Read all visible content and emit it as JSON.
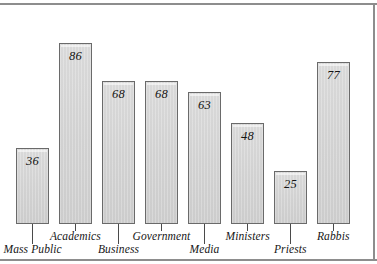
{
  "chart_data": {
    "type": "bar",
    "title": "",
    "subtitle": "",
    "xlabel": "",
    "ylabel": "",
    "ylim": [
      0,
      100
    ],
    "grid": false,
    "legend": null,
    "categories": [
      "Mass Public",
      "Academics",
      "Business",
      "Government",
      "Media",
      "Ministers",
      "Priests",
      "Rabbis"
    ],
    "values": [
      36,
      86,
      68,
      68,
      63,
      48,
      25,
      77
    ],
    "value_labels": [
      "36",
      "86",
      "68",
      "68",
      "63",
      "48",
      "25",
      "77"
    ],
    "label_rows": [
      1,
      0,
      1,
      0,
      1,
      0,
      1,
      0
    ],
    "series": [
      {
        "name": "",
        "values": [
          36,
          86,
          68,
          68,
          63,
          48,
          25,
          77
        ]
      }
    ],
    "bars": [
      {
        "category": "Mass Public",
        "value": 36,
        "label": "36",
        "row": 1
      },
      {
        "category": "Academics",
        "value": 86,
        "label": "86",
        "row": 0
      },
      {
        "category": "Business",
        "value": 68,
        "label": "68",
        "row": 1
      },
      {
        "category": "Government",
        "value": 68,
        "label": "68",
        "row": 0
      },
      {
        "category": "Media",
        "value": 63,
        "label": "63",
        "row": 1
      },
      {
        "category": "Ministers",
        "value": 48,
        "label": "48",
        "row": 0
      },
      {
        "category": "Priests",
        "value": 25,
        "label": "25",
        "row": 1
      },
      {
        "category": "Rabbis",
        "value": 77,
        "label": "77",
        "row": 0
      }
    ],
    "colors": {
      "bar_fill": "#d6d6d6",
      "bar_border": "#6a6a6a",
      "text": "#161616",
      "frame": "#8d8d8d",
      "background": "#ffffff"
    }
  }
}
